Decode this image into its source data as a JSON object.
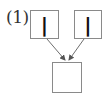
{
  "diagram": {
    "label": "(1)",
    "inputs": [
      {
        "value": "|"
      },
      {
        "value": "|"
      }
    ],
    "output": {
      "value": ""
    },
    "colors": {
      "box_border": "#8a8a8a",
      "arrow": "#6e6e6e",
      "text": "#111111"
    }
  }
}
